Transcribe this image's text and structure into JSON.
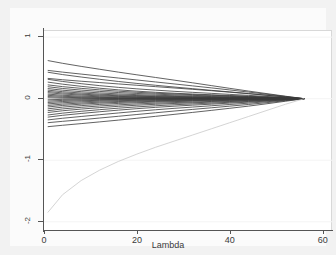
{
  "chart_data": {
    "type": "line",
    "title": "",
    "subtitle": "",
    "xlabel": "Lambda",
    "ylabel": "",
    "xlim": [
      0,
      62
    ],
    "ylim": [
      -2.15,
      1.1
    ],
    "xticks": [
      0,
      20,
      40,
      60
    ],
    "xtick_labels": [
      "0",
      "20",
      "40",
      "60"
    ],
    "yticks": [
      1,
      0,
      -1,
      -2
    ],
    "ytick_labels": [
      "1",
      "0",
      "-1",
      "-2"
    ],
    "grid": "faint-horizontal",
    "legend": "none",
    "annotations": [],
    "convergence_lambda": 56,
    "colors": {
      "series_default": "#3a3a3a",
      "outlier": "#c9c9c9",
      "axis": "#555555",
      "grid": "#f4f4f4",
      "plot_background": "#ffffff",
      "figure_background": "#f2f2f2"
    },
    "x": [
      0.8,
      4,
      8,
      12,
      16,
      20,
      24,
      28,
      32,
      36,
      40,
      44,
      48,
      52,
      56
    ],
    "series": [
      {
        "name": "b1",
        "color": "#3a3a3a",
        "values": [
          0.62,
          0.575,
          0.525,
          0.478,
          0.432,
          0.388,
          0.345,
          0.302,
          0.258,
          0.213,
          0.168,
          0.124,
          0.082,
          0.04,
          0.0
        ]
      },
      {
        "name": "b2",
        "color": "#3a3a3a",
        "values": [
          0.46,
          0.432,
          0.4,
          0.368,
          0.336,
          0.304,
          0.272,
          0.24,
          0.208,
          0.176,
          0.142,
          0.108,
          0.072,
          0.036,
          0.0
        ]
      },
      {
        "name": "b3",
        "color": "#3a3a3a",
        "values": [
          0.43,
          0.392,
          0.352,
          0.315,
          0.28,
          0.248,
          0.218,
          0.19,
          0.163,
          0.136,
          0.11,
          0.084,
          0.056,
          0.028,
          0.0
        ]
      },
      {
        "name": "b4",
        "color": "#3a3a3a",
        "values": [
          0.33,
          0.308,
          0.284,
          0.262,
          0.24,
          0.218,
          0.196,
          0.174,
          0.152,
          0.13,
          0.106,
          0.081,
          0.055,
          0.028,
          0.0
        ]
      },
      {
        "name": "b5",
        "color": "#3a3a3a",
        "values": [
          0.315,
          0.28,
          0.244,
          0.212,
          0.184,
          0.16,
          0.139,
          0.12,
          0.103,
          0.087,
          0.07,
          0.054,
          0.036,
          0.018,
          0.0
        ]
      },
      {
        "name": "b6",
        "color": "#3a3a3a",
        "values": [
          0.27,
          0.236,
          0.201,
          0.17,
          0.144,
          0.122,
          0.104,
          0.089,
          0.076,
          0.064,
          0.052,
          0.04,
          0.027,
          0.014,
          0.0
        ]
      },
      {
        "name": "b7",
        "color": "#3a3a3a",
        "values": [
          0.225,
          0.196,
          0.168,
          0.143,
          0.122,
          0.104,
          0.089,
          0.077,
          0.066,
          0.056,
          0.045,
          0.035,
          0.023,
          0.012,
          0.0
        ]
      },
      {
        "name": "b8",
        "color": "#3a3a3a",
        "values": [
          0.195,
          0.166,
          0.14,
          0.118,
          0.1,
          0.085,
          0.073,
          0.063,
          0.054,
          0.045,
          0.037,
          0.028,
          0.019,
          0.01,
          0.0
        ]
      },
      {
        "name": "b9",
        "color": "#3a3a3a",
        "values": [
          0.165,
          0.138,
          0.114,
          0.094,
          0.078,
          0.066,
          0.056,
          0.048,
          0.041,
          0.035,
          0.028,
          0.022,
          0.015,
          0.007,
          0.0
        ]
      },
      {
        "name": "b10",
        "color": "#3a3a3a",
        "values": [
          0.14,
          0.114,
          0.092,
          0.074,
          0.061,
          0.051,
          0.043,
          0.037,
          0.032,
          0.027,
          0.022,
          0.017,
          0.011,
          0.006,
          0.0
        ]
      },
      {
        "name": "b11",
        "color": "#3a3a3a",
        "values": [
          0.118,
          0.094,
          0.074,
          0.059,
          0.048,
          0.04,
          0.034,
          0.029,
          0.025,
          0.021,
          0.017,
          0.013,
          0.009,
          0.004,
          0.0
        ]
      },
      {
        "name": "b12",
        "color": "#3a3a3a",
        "values": [
          0.098,
          0.076,
          0.059,
          0.046,
          0.037,
          0.031,
          0.026,
          0.022,
          0.019,
          0.016,
          0.013,
          0.01,
          0.007,
          0.003,
          0.0
        ]
      },
      {
        "name": "b13",
        "color": "#3a3a3a",
        "values": [
          0.075,
          0.056,
          0.042,
          0.032,
          0.026,
          0.021,
          0.018,
          0.015,
          0.013,
          0.011,
          0.009,
          0.007,
          0.005,
          0.002,
          0.0
        ]
      },
      {
        "name": "b14",
        "color": "#3a3a3a",
        "values": [
          0.055,
          0.039,
          0.028,
          0.021,
          0.017,
          0.014,
          0.012,
          0.01,
          0.008,
          0.007,
          0.006,
          0.004,
          0.003,
          0.001,
          0.0
        ]
      },
      {
        "name": "b15",
        "color": "#3a3a3a",
        "values": [
          0.035,
          0.023,
          0.016,
          0.012,
          0.009,
          0.008,
          0.007,
          0.006,
          0.005,
          0.004,
          0.003,
          0.002,
          0.002,
          0.001,
          0.0
        ]
      },
      {
        "name": "b16",
        "color": "#3a3a3a",
        "values": [
          0.015,
          0.009,
          0.006,
          0.004,
          0.003,
          0.003,
          0.002,
          0.002,
          0.002,
          0.001,
          0.001,
          0.001,
          0.001,
          0.0,
          0.0
        ]
      },
      {
        "name": "b17",
        "color": "#3a3a3a",
        "values": [
          -0.018,
          -0.011,
          -0.007,
          -0.005,
          -0.004,
          -0.003,
          -0.003,
          -0.002,
          -0.002,
          -0.002,
          -0.001,
          -0.001,
          -0.001,
          0.0,
          0.0
        ]
      },
      {
        "name": "b18",
        "color": "#3a3a3a",
        "values": [
          -0.04,
          -0.028,
          -0.02,
          -0.015,
          -0.012,
          -0.01,
          -0.009,
          -0.007,
          -0.006,
          -0.005,
          -0.004,
          -0.003,
          -0.002,
          -0.001,
          0.0
        ]
      },
      {
        "name": "b19",
        "color": "#3a3a3a",
        "values": [
          -0.062,
          -0.046,
          -0.034,
          -0.026,
          -0.021,
          -0.017,
          -0.015,
          -0.013,
          -0.011,
          -0.009,
          -0.007,
          -0.006,
          -0.004,
          -0.002,
          0.0
        ]
      },
      {
        "name": "b20",
        "color": "#3a3a3a",
        "values": [
          -0.085,
          -0.066,
          -0.051,
          -0.04,
          -0.032,
          -0.027,
          -0.023,
          -0.02,
          -0.017,
          -0.014,
          -0.011,
          -0.009,
          -0.006,
          -0.003,
          0.0
        ]
      },
      {
        "name": "b21",
        "color": "#3a3a3a",
        "values": [
          -0.11,
          -0.088,
          -0.07,
          -0.056,
          -0.046,
          -0.038,
          -0.032,
          -0.028,
          -0.024,
          -0.02,
          -0.016,
          -0.012,
          -0.008,
          -0.004,
          0.0
        ]
      },
      {
        "name": "b22",
        "color": "#3a3a3a",
        "values": [
          -0.135,
          -0.11,
          -0.089,
          -0.072,
          -0.06,
          -0.05,
          -0.043,
          -0.037,
          -0.031,
          -0.026,
          -0.021,
          -0.016,
          -0.011,
          -0.005,
          0.0
        ]
      },
      {
        "name": "b23",
        "color": "#3a3a3a",
        "values": [
          -0.165,
          -0.137,
          -0.113,
          -0.093,
          -0.077,
          -0.065,
          -0.055,
          -0.047,
          -0.04,
          -0.034,
          -0.027,
          -0.021,
          -0.014,
          -0.007,
          0.0
        ]
      },
      {
        "name": "b24",
        "color": "#3a3a3a",
        "values": [
          -0.195,
          -0.166,
          -0.14,
          -0.118,
          -0.1,
          -0.085,
          -0.073,
          -0.063,
          -0.054,
          -0.045,
          -0.036,
          -0.028,
          -0.019,
          -0.01,
          0.0
        ]
      },
      {
        "name": "b25",
        "color": "#3a3a3a",
        "values": [
          -0.225,
          -0.196,
          -0.169,
          -0.145,
          -0.124,
          -0.106,
          -0.091,
          -0.078,
          -0.067,
          -0.056,
          -0.046,
          -0.035,
          -0.024,
          -0.012,
          0.0
        ]
      },
      {
        "name": "b26",
        "color": "#3a3a3a",
        "values": [
          -0.265,
          -0.235,
          -0.205,
          -0.178,
          -0.154,
          -0.133,
          -0.115,
          -0.099,
          -0.085,
          -0.072,
          -0.058,
          -0.045,
          -0.03,
          -0.015,
          0.0
        ]
      },
      {
        "name": "b27",
        "color": "#3a3a3a",
        "values": [
          -0.3,
          -0.27,
          -0.24,
          -0.212,
          -0.186,
          -0.162,
          -0.141,
          -0.122,
          -0.105,
          -0.089,
          -0.072,
          -0.056,
          -0.038,
          -0.019,
          0.0
        ]
      },
      {
        "name": "b28",
        "color": "#3a3a3a",
        "values": [
          -0.345,
          -0.318,
          -0.289,
          -0.26,
          -0.232,
          -0.205,
          -0.18,
          -0.157,
          -0.136,
          -0.115,
          -0.094,
          -0.073,
          -0.049,
          -0.025,
          0.0
        ]
      },
      {
        "name": "b29",
        "color": "#3a3a3a",
        "values": [
          -0.39,
          -0.368,
          -0.342,
          -0.314,
          -0.286,
          -0.257,
          -0.229,
          -0.201,
          -0.174,
          -0.148,
          -0.121,
          -0.094,
          -0.064,
          -0.032,
          0.0
        ]
      },
      {
        "name": "b30",
        "color": "#3a3a3a",
        "values": [
          -0.455,
          -0.432,
          -0.405,
          -0.377,
          -0.348,
          -0.318,
          -0.287,
          -0.255,
          -0.223,
          -0.19,
          -0.156,
          -0.121,
          -0.082,
          -0.041,
          0.0
        ]
      },
      {
        "name": "b31_outlier",
        "color": "#c9c9c9",
        "values": [
          -1.85,
          -1.56,
          -1.33,
          -1.16,
          -1.02,
          -0.9,
          -0.79,
          -0.69,
          -0.59,
          -0.49,
          -0.39,
          -0.29,
          -0.19,
          -0.09,
          0.0
        ]
      }
    ]
  }
}
